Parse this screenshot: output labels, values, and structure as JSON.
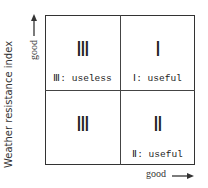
{
  "y_axis": {
    "title": "Weather resistance index",
    "direction_label": "good"
  },
  "x_axis": {
    "direction_label": "good"
  },
  "quadrants": [
    {
      "position": "top-left",
      "numeral": "Ⅲ",
      "caption": "Ⅲ: useless"
    },
    {
      "position": "top-right",
      "numeral": "Ⅰ",
      "caption": "Ⅰ: useful"
    },
    {
      "position": "bottom-left",
      "numeral": "Ⅲ",
      "caption": ""
    },
    {
      "position": "bottom-right",
      "numeral": "Ⅱ",
      "caption": "Ⅱ: useful"
    }
  ]
}
